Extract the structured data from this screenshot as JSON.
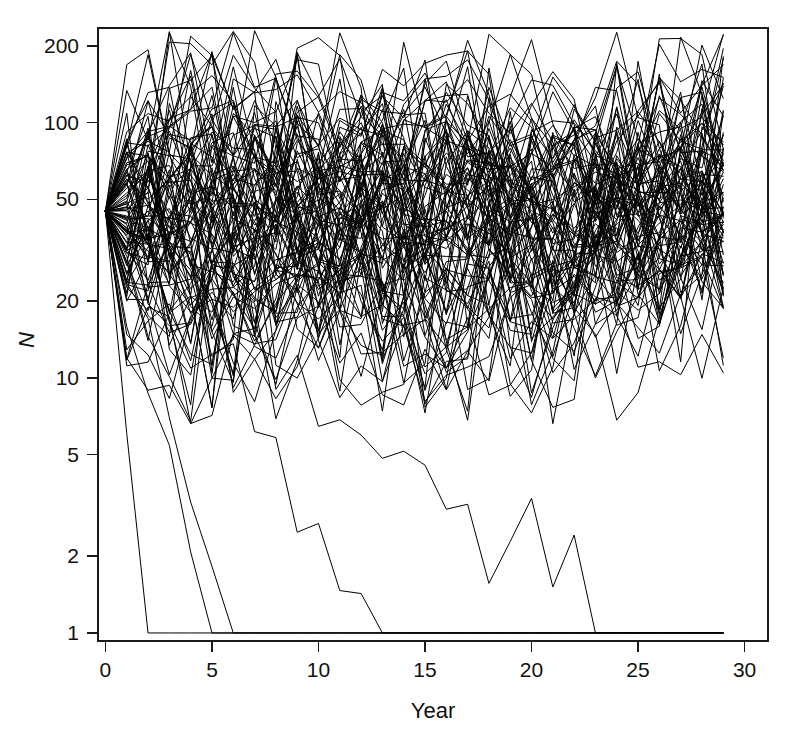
{
  "figure": {
    "width": 804,
    "height": 738,
    "background": "#ffffff",
    "line_color": "#000000",
    "axis_color": "#1a1a1a",
    "text_color": "#111111"
  },
  "chart_data": {
    "type": "line",
    "title": "",
    "subtitle": "",
    "xlabel": "Year",
    "ylabel": "N",
    "xlim": [
      -0.35,
      31.1
    ],
    "ylim": [
      0.93,
      235
    ],
    "yscale": "log",
    "xscale": "linear",
    "grid": false,
    "legend": null,
    "xticks": [
      0,
      5,
      10,
      15,
      20,
      25,
      30
    ],
    "xticklabels": [
      "0",
      "5",
      "10",
      "15",
      "20",
      "25",
      "30"
    ],
    "yticks": [
      1,
      2,
      5,
      10,
      20,
      50,
      100,
      200
    ],
    "yticklabels": [
      "1",
      "2",
      "5",
      "10",
      "20",
      "50",
      "100",
      "200"
    ],
    "n_series": 100,
    "n_years": 30,
    "x": [
      0,
      1,
      2,
      3,
      4,
      5,
      6,
      7,
      8,
      9,
      10,
      11,
      12,
      13,
      14,
      15,
      16,
      17,
      18,
      19,
      20,
      21,
      22,
      23,
      24,
      25,
      26,
      27,
      28,
      29
    ],
    "start_value": 45,
    "model": {
      "kind": "lognormal-random-walk-with-ceiling",
      "log_sd": 0.55,
      "mean_log_drift": 0.0,
      "ceiling": 230,
      "floor": 1,
      "absorbing_floor": true,
      "seed": 20240517
    },
    "extinction_years": [
      2,
      5,
      6,
      13,
      24
    ],
    "series_summary": [
      {
        "name": "surviving replicates",
        "count": 95,
        "typical_range": [
          8,
          230
        ]
      },
      {
        "name": "extinct replicates",
        "count": 5,
        "extinct_at_years": [
          2,
          5,
          6,
          13,
          24
        ]
      }
    ],
    "annotations": []
  },
  "axes": {
    "x_axis_name": "Year",
    "y_axis_name": "N"
  }
}
